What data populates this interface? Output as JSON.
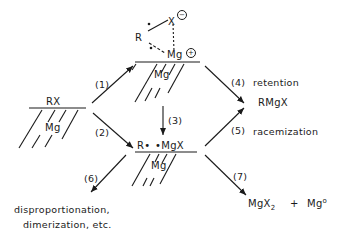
{
  "diagram": {
    "type": "reaction-mechanism",
    "nodes": {
      "start": {
        "surface_label": "Mg",
        "adsorbate": "RX"
      },
      "complex": {
        "surface_label": "Mg",
        "r": "R",
        "x": "X",
        "mg": "Mg",
        "x_charge": "−",
        "mg_charge": "+"
      },
      "radical_pair": {
        "surface_label": "Mg",
        "r_radical": "R•",
        "mgx_radical": "•MgX"
      },
      "grignard": {
        "label": "RMgX"
      },
      "side_products": {
        "line1": "disproportionation,",
        "line2": "dimerization, etc."
      },
      "schlenk": {
        "mgx2": "MgX",
        "mgx2_sub": "2",
        "plus": "+",
        "mg0": "Mg",
        "mg0_sup": "o"
      }
    },
    "steps": [
      {
        "id": "1",
        "label": "(1)"
      },
      {
        "id": "2",
        "label": "(2)"
      },
      {
        "id": "3",
        "label": "(3)"
      },
      {
        "id": "4",
        "label": "(4)",
        "description": "retention"
      },
      {
        "id": "5",
        "label": "(5)",
        "description": "racemization"
      },
      {
        "id": "6",
        "label": "(6)"
      },
      {
        "id": "7",
        "label": "(7)"
      }
    ],
    "colors": {
      "ink": "#1a1a1a",
      "background": "#ffffff"
    }
  }
}
